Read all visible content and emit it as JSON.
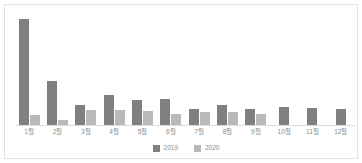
{
  "chart_data": {
    "type": "bar",
    "title": "",
    "subtitle": "",
    "xlabel": "",
    "ylabel": "",
    "grid": false,
    "legend_position": "bottom-center",
    "ylim": [
      0,
      100
    ],
    "categories": [
      "1월",
      "2월",
      "3월",
      "4월",
      "5월",
      "6월",
      "7월",
      "8월",
      "9월",
      "10월",
      "11월",
      "12월"
    ],
    "series": [
      {
        "name": "2019",
        "color": "#808080",
        "values": [
          100,
          42,
          20,
          29,
          24,
          25,
          16,
          20,
          16,
          18,
          17,
          16
        ]
      },
      {
        "name": "2020",
        "color": "#b9b9b9",
        "values": [
          10,
          6,
          15,
          15,
          14,
          11,
          13,
          13,
          11,
          null,
          null,
          null
        ]
      }
    ]
  },
  "frame": {
    "border_color": "#e3e3e3",
    "background": "#ffffff"
  }
}
